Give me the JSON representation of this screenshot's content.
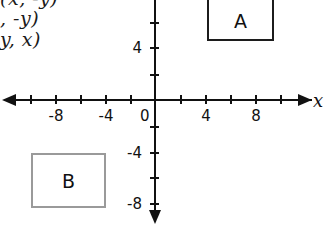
{
  "rules": {
    "lines": [
      "(x, -y)",
      ", -y)",
      "y, x)"
    ]
  },
  "axes": {
    "x_label": "x",
    "x_ticks": [
      {
        "value": -8,
        "label": "-8",
        "px": 55
      },
      {
        "value": -6,
        "label": "",
        "px": 80
      },
      {
        "value": -4,
        "label": "-4",
        "px": 105
      },
      {
        "value": -2,
        "label": "",
        "px": 130
      },
      {
        "value": 2,
        "label": "",
        "px": 180
      },
      {
        "value": 4,
        "label": "4",
        "px": 205
      },
      {
        "value": 6,
        "label": "",
        "px": 230
      },
      {
        "value": 8,
        "label": "8",
        "px": 255
      },
      {
        "value": 10,
        "label": "",
        "px": 280
      },
      {
        "value": -10,
        "label": "",
        "px": 30
      }
    ],
    "y_ticks": [
      {
        "value": 8,
        "label": "",
        "px": 22
      },
      {
        "value": 6,
        "label": "",
        "px": 47
      },
      {
        "value": 4,
        "label": "4",
        "px": 47
      },
      {
        "value": 2,
        "label": "",
        "px": 74
      },
      {
        "value": -2,
        "label": "",
        "px": 126
      },
      {
        "value": -4,
        "label": "-4",
        "px": 152
      },
      {
        "value": -6,
        "label": "",
        "px": 177
      },
      {
        "value": -8,
        "label": "-8",
        "px": 203
      }
    ],
    "origin_label": "0"
  },
  "figures": [
    {
      "name": "A",
      "label": "A"
    },
    {
      "name": "B",
      "label": "B"
    }
  ],
  "colors": {
    "axis": "#111111",
    "box_a_border": "#1c1c1c",
    "box_b_border": "#9a9a9a",
    "text": "#111111",
    "background": "#ffffff"
  }
}
